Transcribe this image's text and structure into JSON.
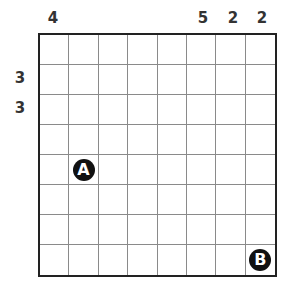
{
  "puzzle": {
    "rows": 8,
    "cols": 8,
    "column_clues": [
      {
        "col": 1,
        "value": "4"
      },
      {
        "col": 6,
        "value": "5"
      },
      {
        "col": 7,
        "value": "2"
      },
      {
        "col": 8,
        "value": "2"
      }
    ],
    "row_clues": [
      {
        "row": 2,
        "value": "3"
      },
      {
        "row": 3,
        "value": "3"
      }
    ],
    "markers": [
      {
        "label": "A",
        "row": 5,
        "col": 2
      },
      {
        "label": "B",
        "row": 8,
        "col": 8
      }
    ],
    "colors": {
      "border": "#222222",
      "gridline": "#8a8a8a",
      "marker_fill": "#111111",
      "marker_text": "#ffffff",
      "clue_text": "#333333"
    }
  }
}
